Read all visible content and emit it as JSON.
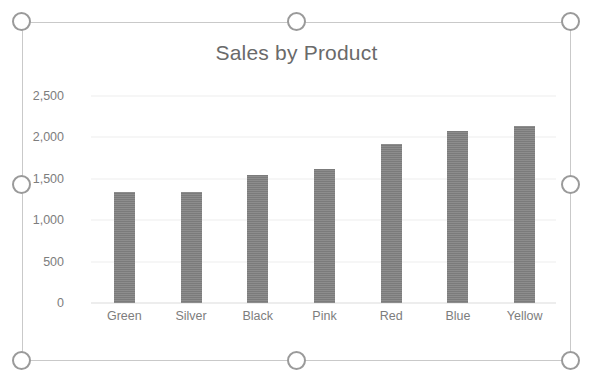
{
  "selection": {
    "state": "selected",
    "handles": [
      {
        "name": "resize-handle-top-left",
        "position": "top-left"
      },
      {
        "name": "resize-handle-top-center",
        "position": "top-center"
      },
      {
        "name": "resize-handle-top-right",
        "position": "top-right"
      },
      {
        "name": "resize-handle-middle-left",
        "position": "middle-left"
      },
      {
        "name": "resize-handle-middle-right",
        "position": "middle-right"
      },
      {
        "name": "resize-handle-bottom-left",
        "position": "bottom-left"
      },
      {
        "name": "resize-handle-bottom-center",
        "position": "bottom-center"
      },
      {
        "name": "resize-handle-bottom-right",
        "position": "bottom-right"
      }
    ]
  },
  "colors": {
    "bar_fill": "#808080",
    "text": "#7d7d7d",
    "title_text": "#6a6a6a",
    "gridline": "#ededed",
    "axis_line": "#dcdcdc",
    "handle_stroke": "#9a9a9a",
    "handle_fill": "#ffffff",
    "object_border": "#c9c9c9",
    "plot_background": "#ffffff"
  },
  "chart_data": {
    "type": "bar",
    "title": "Sales by Product",
    "xlabel": "",
    "ylabel": "",
    "categories": [
      "Green",
      "Silver",
      "Black",
      "Pink",
      "Red",
      "Blue",
      "Yellow"
    ],
    "values": [
      1345,
      1345,
      1550,
      1615,
      1925,
      2075,
      2140
    ],
    "series": [
      {
        "name": "Sales",
        "values": [
          1345,
          1345,
          1550,
          1615,
          1925,
          2075,
          2140
        ]
      }
    ],
    "ylim": [
      0,
      2500
    ],
    "ytick_values": [
      0,
      500,
      1000,
      1500,
      2000,
      2500
    ],
    "ytick_labels": [
      "0",
      "500",
      "1,000",
      "1,500",
      "2,000",
      "2,500"
    ],
    "grid": true,
    "legend": false,
    "legend_position": "none",
    "orientation": "vertical"
  }
}
